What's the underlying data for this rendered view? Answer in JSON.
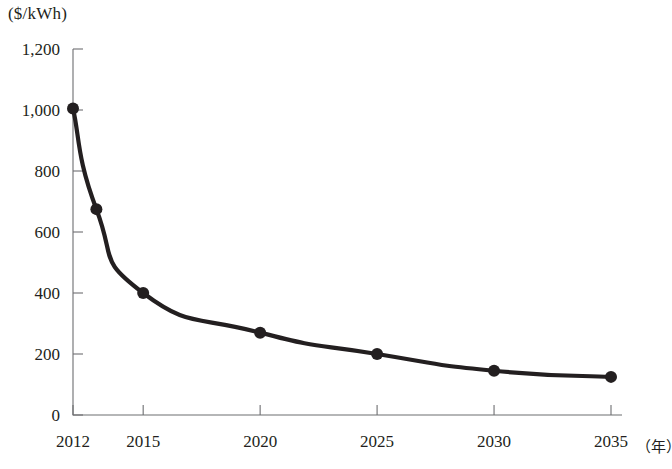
{
  "chart_data": {
    "type": "line",
    "title": "",
    "subtitle": "",
    "xlabel": "（年）",
    "ylabel": "($/kWh)",
    "x": [
      2012,
      2013,
      2015,
      2020,
      2025,
      2030,
      2035
    ],
    "values": [
      1005,
      675,
      400,
      270,
      200,
      145,
      125
    ],
    "series": [
      {
        "name": "",
        "values": [
          1005,
          675,
          400,
          270,
          200,
          145,
          125
        ],
        "color": "#231f20",
        "marker": "filled-circle"
      }
    ],
    "xlim": [
      2012,
      2035.5
    ],
    "ylim": [
      0,
      1200
    ],
    "xtick_values": [
      2012,
      2015,
      2020,
      2025,
      2030,
      2035
    ],
    "xtick_labels": [
      "2012",
      "2015",
      "2020",
      "2025",
      "2030",
      "2035"
    ],
    "ytick_values": [
      0,
      200,
      400,
      600,
      800,
      1000,
      1200
    ],
    "ytick_labels": [
      "0",
      "200",
      "400",
      "600",
      "800",
      "1,000",
      "1,200"
    ],
    "grid": false,
    "legend": null,
    "legend_position": "none",
    "annotations": []
  },
  "axes": {
    "y_unit_text": "($/kWh)",
    "x_unit_text": "（年）"
  },
  "colors": {
    "series": "#231f20",
    "axis": "#6d6e71",
    "background": "#ffffff",
    "text": "#231f20"
  }
}
